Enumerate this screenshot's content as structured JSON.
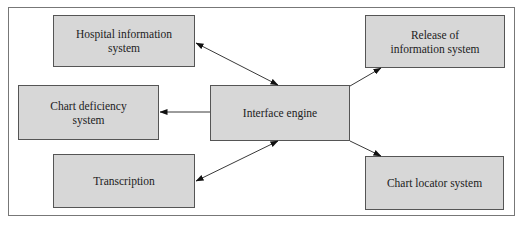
{
  "caption": "Figure: Interface engine linking health information systems",
  "nodes": {
    "hospital_info": {
      "label_line1": "Hospital information",
      "label_line2": "system"
    },
    "release": {
      "label_line1": "Release of",
      "label_line2": "information system"
    },
    "chart_deficiency": {
      "label_line1": "Chart deficiency",
      "label_line2": "system"
    },
    "interface_engine": {
      "label": "Interface engine"
    },
    "transcription": {
      "label": "Transcription"
    },
    "chart_locator": {
      "label": "Chart locator system"
    }
  },
  "edges": [
    {
      "from": "hospital_info",
      "to": "interface_engine",
      "direction": "both"
    },
    {
      "from": "interface_engine",
      "to": "release",
      "direction": "forward"
    },
    {
      "from": "interface_engine",
      "to": "chart_deficiency",
      "direction": "forward"
    },
    {
      "from": "transcription",
      "to": "interface_engine",
      "direction": "both"
    },
    {
      "from": "interface_engine",
      "to": "chart_locator",
      "direction": "forward"
    }
  ],
  "colors": {
    "box_fill": "#d7d7d7",
    "border": "#555555",
    "frame": "#777777"
  }
}
